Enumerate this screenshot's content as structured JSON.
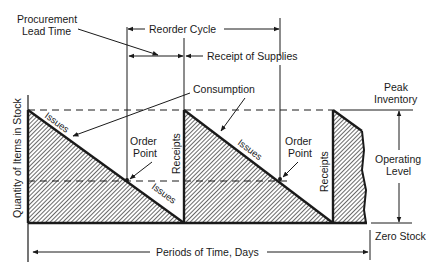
{
  "diagram": {
    "labels": {
      "procurement_lead_time_line1": "Procurement",
      "procurement_lead_time_line2": "Lead Time",
      "reorder_cycle": "Reorder Cycle",
      "receipt_of_supplies": "Receipt of Supplies",
      "consumption": "Consumption",
      "peak_inventory_line1": "Peak",
      "peak_inventory_line2": "Inventory",
      "operating_level_line1": "Operating",
      "operating_level_line2": "Level",
      "zero_stock": "Zero Stock",
      "y_axis": "Quantity of Items in Stock",
      "x_axis": "Periods of Time, Days",
      "issues_1": "Issues",
      "issues_2": "Issues",
      "issues_3": "Issues",
      "order_point_1_line1": "Order",
      "order_point_1_line2": "Point",
      "order_point_2_line1": "Order",
      "order_point_2_line2": "Point",
      "receipts_1": "Receipts",
      "receipts_2": "Receipts"
    },
    "colors": {
      "ink": "#1a1a1a",
      "background": "#ffffff"
    }
  }
}
